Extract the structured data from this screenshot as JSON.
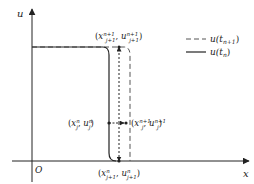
{
  "axes": {
    "y_label": "u",
    "x_label": "x",
    "origin_label": "O"
  },
  "legend": [
    {
      "style": "dashed",
      "label": "u(t",
      "sub": "n+1",
      "close": ")"
    },
    {
      "style": "solid",
      "label": "u(t",
      "sub": "n",
      "close": ")"
    }
  ],
  "points": {
    "top": {
      "x": "x",
      "xsub": "j+1",
      "xsup": "n+1",
      "u": "u",
      "usub": "j+1",
      "usup": "n+1"
    },
    "left": {
      "x": "x",
      "xsub": "j",
      "xsup": "n",
      "u": "u",
      "usub": "j",
      "usup": "n"
    },
    "right": {
      "x": "x",
      "xsub": "j",
      "xsup": "n+1",
      "u": "u",
      "usub": "j",
      "usup": "n+1"
    },
    "bottom": {
      "x": "x",
      "xsub": "j+1",
      "xsup": "n",
      "u": "u",
      "usub": "j+1",
      "usup": "n"
    }
  },
  "colors": {
    "line": "#222222",
    "dashed": "#555555"
  }
}
